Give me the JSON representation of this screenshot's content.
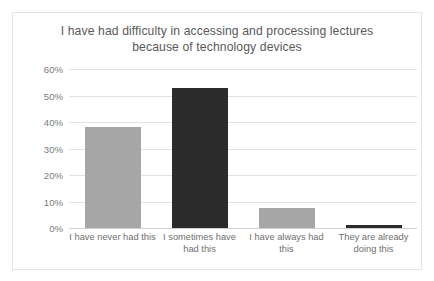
{
  "chart_data": {
    "type": "bar",
    "title": "I have had difficulty in accessing and processing lectures because of technology devices",
    "title_line1": "I have had difficulty in accessing and processing lectures",
    "title_line2": "because of technology devices",
    "xlabel": "",
    "ylabel": "",
    "categories": [
      "I have never had this",
      "I sometimes have had this",
      "I have always had this",
      "They are already doing this"
    ],
    "values": [
      38,
      53,
      7.5,
      1
    ],
    "value_labels": [
      "38%",
      "53%",
      "8%",
      "1%"
    ],
    "bar_colors": [
      "#a6a6a6",
      "#2b2b2b",
      "#a6a6a6",
      "#2b2b2b"
    ],
    "ylim": [
      0,
      60
    ],
    "ytick_values": [
      0,
      10,
      20,
      30,
      40,
      50,
      60
    ],
    "ytick_labels": [
      "0%",
      "10%",
      "20%",
      "30%",
      "40%",
      "50%",
      "60%"
    ],
    "grid": true,
    "legend": false,
    "legend_position": "none"
  },
  "style": {
    "background": "#ffffff",
    "border_color": "#e4e4e4",
    "gridline_color": "#e2e2e2",
    "axis_color": "#d0d0d0",
    "title_color": "#595959",
    "tick_color": "#7b7b7b",
    "category_label_color": "#6f6f6f"
  }
}
